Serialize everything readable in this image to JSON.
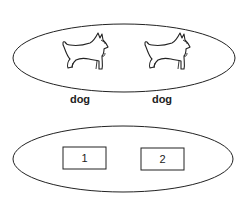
{
  "diagram": {
    "top_set": {
      "items": [
        {
          "icon": "scottish-terrier-dog-icon",
          "label": "dog"
        },
        {
          "icon": "scottish-terrier-dog-icon",
          "label": "dog"
        }
      ]
    },
    "bottom_set": {
      "items": [
        {
          "label": "1"
        },
        {
          "label": "2"
        }
      ]
    },
    "colors": {
      "stroke": "#222222",
      "background": "#ffffff"
    }
  }
}
